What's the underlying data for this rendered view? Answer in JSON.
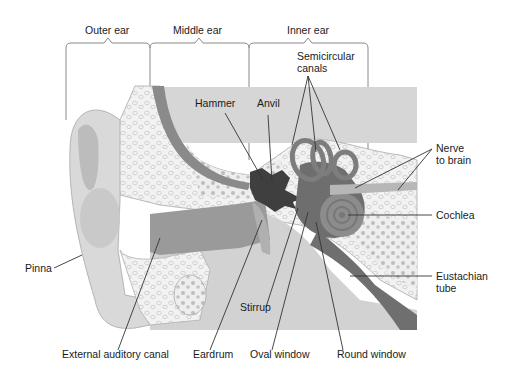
{
  "figure": {
    "regions": [
      {
        "label": "Outer ear"
      },
      {
        "label": "Middle ear"
      },
      {
        "label": "Inner ear"
      }
    ],
    "labels": {
      "semicircular_canals_line1": "Semicircular",
      "semicircular_canals_line2": "canals",
      "hammer": "Hammer",
      "anvil": "Anvil",
      "nerve_line1": "Nerve",
      "nerve_line2": "to brain",
      "cochlea": "Cochlea",
      "pinna": "Pinna",
      "eustachian_line1": "Eustachian",
      "eustachian_line2": "tube",
      "stirrup": "Stirrup",
      "external_auditory_canal": "External auditory canal",
      "eardrum": "Eardrum",
      "oval_window": "Oval window",
      "round_window": "Round window"
    },
    "colors": {
      "background": "#ffffff",
      "skin_light": "#d9d9d9",
      "skin_mid": "#c4c4c4",
      "canal_dark": "#8f8f8f",
      "bone_fill": "#efefef",
      "bone_cells": "#bdbdbd",
      "inner_panel": "#d6d6d6",
      "labyrinth": "#7a7a7a",
      "ossicles": "#3f3f3f",
      "bracket": "#8a8a8a"
    }
  }
}
